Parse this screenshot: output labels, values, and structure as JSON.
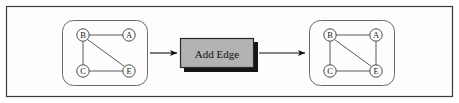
{
  "figure": {
    "frame": {
      "border_color": "#3a3a3a",
      "background_color": "#fdfdfd"
    },
    "edge_color": "#5a5a5a",
    "node_stroke_color": "#4a4a4a",
    "node_fill_color": "#ffffff",
    "arrow_color": "#111111"
  },
  "left_graph": {
    "name": "input-graph",
    "nodes": [
      {
        "id": "B",
        "label": "B",
        "x": 83,
        "y": 35
      },
      {
        "id": "A",
        "label": "A",
        "x": 129,
        "y": 35
      },
      {
        "id": "C",
        "label": "C",
        "x": 83,
        "y": 71
      },
      {
        "id": "E",
        "label": "E",
        "x": 129,
        "y": 71
      }
    ],
    "edges": [
      {
        "from": "B",
        "to": "A"
      },
      {
        "from": "B",
        "to": "C"
      },
      {
        "from": "B",
        "to": "E"
      },
      {
        "from": "C",
        "to": "E"
      }
    ],
    "container": {
      "x": 62,
      "y": 20,
      "width": 86,
      "height": 66,
      "radius": 11
    }
  },
  "operation": {
    "name": "add-edge-operation",
    "label": "Add Edge",
    "box": {
      "x": 180,
      "y": 38,
      "width": 74,
      "height": 30
    },
    "fill_color": "#b3b3b3",
    "border_color": "#2b2b2b",
    "shadow_color": "#151515",
    "shadow_offset": 4
  },
  "right_graph": {
    "name": "output-graph",
    "nodes": [
      {
        "id": "B",
        "label": "B",
        "x": 330,
        "y": 35
      },
      {
        "id": "A",
        "label": "A",
        "x": 376,
        "y": 35
      },
      {
        "id": "C",
        "label": "C",
        "x": 330,
        "y": 71
      },
      {
        "id": "E",
        "label": "E",
        "x": 376,
        "y": 71
      }
    ],
    "edges": [
      {
        "from": "B",
        "to": "A"
      },
      {
        "from": "B",
        "to": "C"
      },
      {
        "from": "B",
        "to": "E"
      },
      {
        "from": "C",
        "to": "E"
      },
      {
        "from": "A",
        "to": "E"
      }
    ],
    "container": {
      "x": 309,
      "y": 20,
      "width": 86,
      "height": 66,
      "radius": 11
    }
  },
  "arrows": [
    {
      "name": "arrow-input-to-operation",
      "x1": 150,
      "y1": 53,
      "x2": 178,
      "y2": 53
    },
    {
      "name": "arrow-operation-to-output",
      "x1": 258,
      "y1": 53,
      "x2": 306,
      "y2": 53
    }
  ]
}
